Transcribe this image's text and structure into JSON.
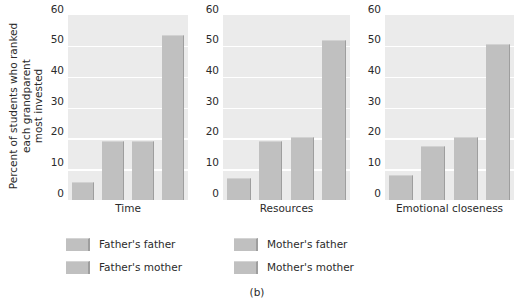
{
  "figure": {
    "caption": "(b)",
    "ylabel_lines": [
      "Percent of students who ranked",
      "each grandparent",
      "most invested"
    ],
    "colors": {
      "plot_background": "#ebebeb",
      "gridline": "#ffffff",
      "bar_fill": "#c0c0c0",
      "bar_shadow": "#9e9e9e",
      "text": "#2b2b2b",
      "page_background": "#ffffff"
    }
  },
  "legend": {
    "entries": [
      {
        "label": "Father's father",
        "color": "#c0c0c0"
      },
      {
        "label": "Mother's father",
        "color": "#c0c0c0"
      },
      {
        "label": "Father's mother",
        "color": "#c0c0c0"
      },
      {
        "label": "Mother's mother",
        "color": "#c0c0c0"
      }
    ]
  },
  "axis": {
    "ticks": [
      "0",
      "10",
      "20",
      "30",
      "40",
      "50",
      "60"
    ]
  },
  "chart_data": {
    "type": "bar",
    "title": "",
    "xlabel": "",
    "ylabel": "Percent of students who ranked each grandparent most invested",
    "ylim": [
      0,
      60
    ],
    "yticks": [
      0,
      10,
      20,
      30,
      40,
      50,
      60
    ],
    "grid": true,
    "legend_position": "below",
    "panels": [
      "Time",
      "Resources",
      "Emotional closeness"
    ],
    "categories": [
      "Father's father",
      "Father's mother",
      "Mother's father",
      "Mother's mother"
    ],
    "series": [
      {
        "name": "Time",
        "values": [
          6,
          19,
          19,
          53.5
        ]
      },
      {
        "name": "Resources",
        "values": [
          7,
          19,
          20.5,
          52
        ]
      },
      {
        "name": "Emotional closeness",
        "values": [
          8,
          17.5,
          20.5,
          50.5
        ]
      }
    ],
    "panel_labels": [
      {
        "label": "Time"
      },
      {
        "label": "Resources"
      },
      {
        "label": "Emotional closeness"
      }
    ]
  }
}
